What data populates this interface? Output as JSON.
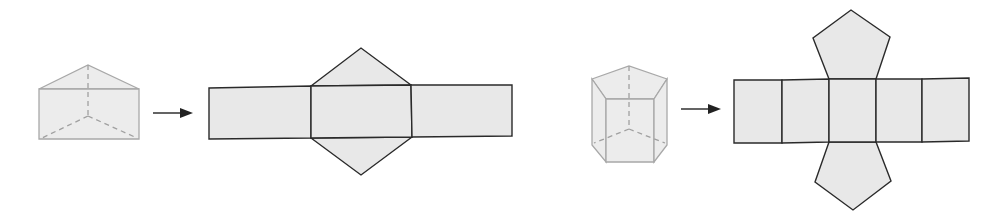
{
  "figure": {
    "colors": {
      "solid_fill": "#ececec",
      "solid_stroke": "#a8a8a8",
      "net_fill": "#e8e8e8",
      "net_stroke": "#2a2a2a",
      "arrow": "#222222"
    },
    "panels": [
      {
        "solid": "triangular-prism",
        "arrow": "right-arrow",
        "net": {
          "shape": "triangular-prism-net",
          "rectangles": 3,
          "triangles": 2
        }
      },
      {
        "solid": "pentagonal-prism",
        "arrow": "right-arrow",
        "net": {
          "shape": "pentagonal-prism-net",
          "rectangles": 5,
          "pentagons": 2
        }
      }
    ]
  }
}
